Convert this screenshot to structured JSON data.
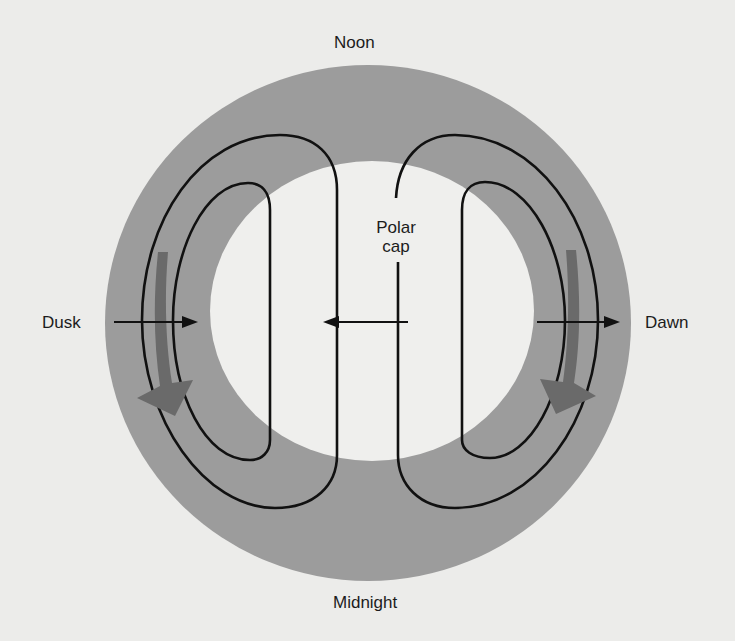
{
  "diagram": {
    "type": "polar convection pattern",
    "labels": {
      "top": "Noon",
      "bottom": "Midnight",
      "left": "Dusk",
      "right": "Dawn",
      "center_line1": "Polar",
      "center_line2": "cap"
    },
    "colors": {
      "background": "#ececea",
      "auroral_oval": "#9c9c9c",
      "polar_cap": "#efefed",
      "flow_lines": "#111111",
      "flow_arrows": "#6a6a6a"
    },
    "elements": {
      "auroral_oval": "gray ring surrounding polar cap",
      "convection_cells": [
        "dusk cell (2 loops)",
        "dawn cell (2 loops)"
      ],
      "electric_field_arrows": [
        "dusk inward arrow",
        "anti-sunward polar cap arrow",
        "dawn outward arrow"
      ],
      "flow_direction_arrows": [
        "dusk sunward-to-antisunward band arrow",
        "dawn band arrow"
      ]
    }
  }
}
